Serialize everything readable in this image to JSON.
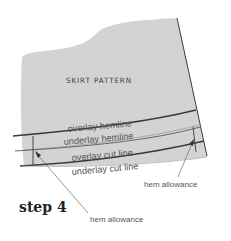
{
  "diagram": {
    "title": "SKIRT PATTERN",
    "step_label": "step 4",
    "lines": {
      "overlay_hemline": "overlay hemline",
      "underlay_hemline": "underlay hemline",
      "overlay_cut_line": "overlay cut line",
      "underlay_cut_line": "underlay cut line"
    },
    "annotations": {
      "hem_allowance_right": "hem allowance",
      "hem_allowance_bottom": "hem allowance"
    },
    "colors": {
      "pattern_fill": "#d3d3d3",
      "line": "#3a3a3a",
      "text": "#555555"
    }
  }
}
